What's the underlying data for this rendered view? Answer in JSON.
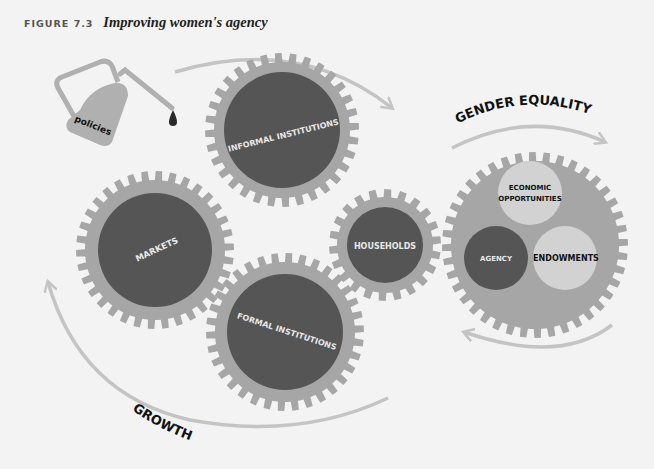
{
  "figure": {
    "label": "FIGURE 7.3",
    "caption": "Improving women's agency"
  },
  "oil_can": {
    "label": "policies",
    "icon": "oil-can-icon"
  },
  "gears": {
    "markets": {
      "label": "MARKETS"
    },
    "informal_institutions": {
      "label": "INFORMAL INSTITUTIONS"
    },
    "formal_institutions": {
      "label": "FORMAL INSTITUTIONS"
    },
    "households": {
      "label": "HOUSEHOLDS"
    },
    "gender_equality": {
      "circles": {
        "economic_opportunities": {
          "line1": "ECONOMIC",
          "line2": "OPPORTUNITIES"
        },
        "agency": {
          "label": "AGENCY"
        },
        "endowments": {
          "label": "ENDOWMENTS"
        }
      }
    }
  },
  "arrows": {
    "gender_equality": {
      "label": "GENDER EQUALITY"
    },
    "growth": {
      "label": "GROWTH"
    }
  },
  "colors": {
    "background": "#f3f3f3",
    "gear_ring": "#a6a6a6",
    "gear_core": "#555555",
    "light_circle": "#d2d2d2",
    "arrow": "#c4c4c4"
  }
}
